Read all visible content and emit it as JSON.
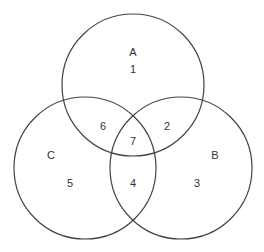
{
  "diagram": {
    "type": "venn-3",
    "stroke_color": "#444444",
    "text_color": "#333333",
    "sets": [
      {
        "name": "A",
        "cx": 133,
        "cy": 85,
        "r": 71,
        "label_x": 133,
        "label_y": 52
      },
      {
        "name": "B",
        "cx": 181,
        "cy": 168,
        "r": 71,
        "label_x": 215,
        "label_y": 155
      },
      {
        "name": "C",
        "cx": 85,
        "cy": 168,
        "r": 71,
        "label_x": 51,
        "label_y": 155
      }
    ],
    "regions": [
      {
        "label": "1",
        "area": "A only",
        "x": 133,
        "y": 69
      },
      {
        "label": "2",
        "area": "A∩B only",
        "x": 167,
        "y": 126
      },
      {
        "label": "3",
        "area": "B only",
        "x": 197,
        "y": 183
      },
      {
        "label": "4",
        "area": "B∩C only",
        "x": 133,
        "y": 183
      },
      {
        "label": "5",
        "area": "C only",
        "x": 70,
        "y": 183
      },
      {
        "label": "6",
        "area": "A∩C only",
        "x": 103,
        "y": 126
      },
      {
        "label": "7",
        "area": "A∩B∩C",
        "x": 133,
        "y": 141
      }
    ]
  }
}
